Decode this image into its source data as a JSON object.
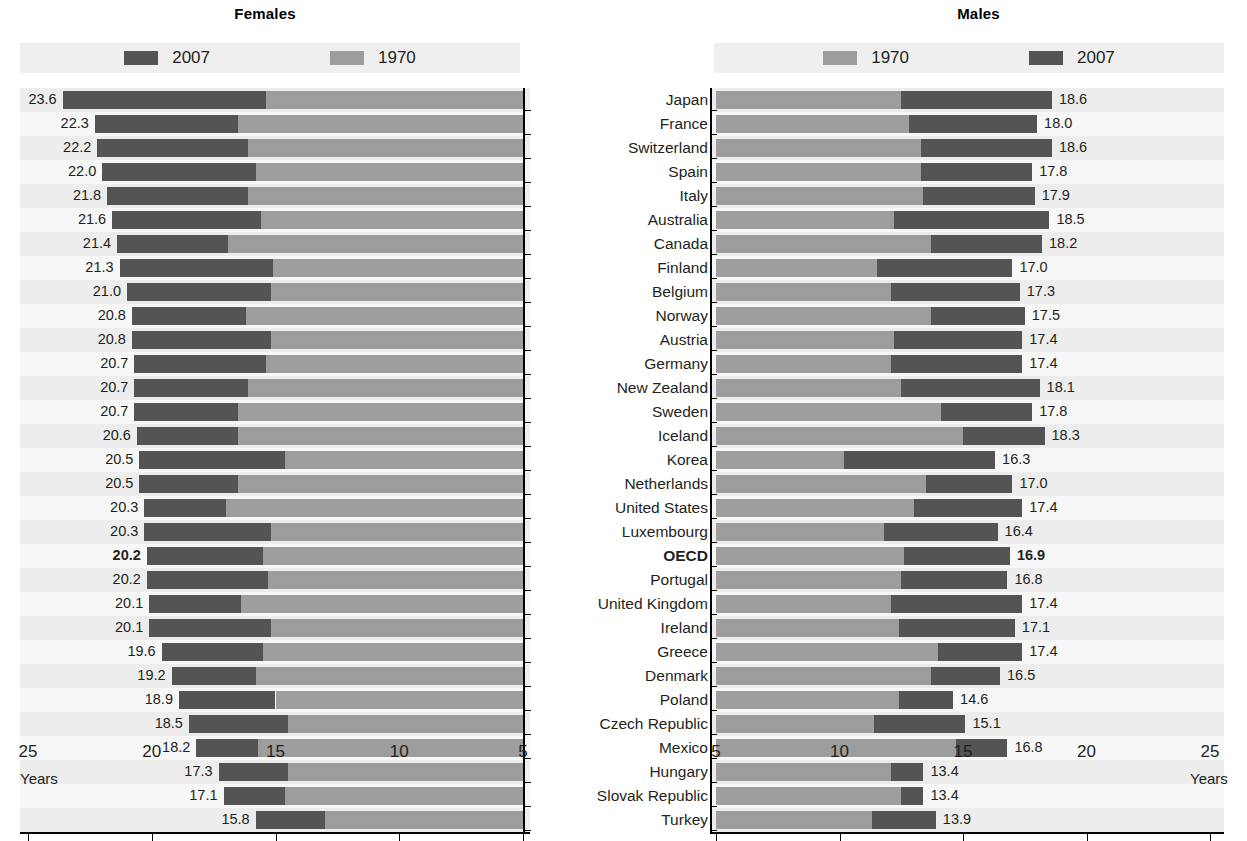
{
  "panels": {
    "females": {
      "title": "Females",
      "legend": [
        {
          "label": "2007",
          "color": "#545454",
          "series": "2007"
        },
        {
          "label": "1970",
          "color": "#9d9d9d",
          "series": "1970"
        }
      ],
      "axis_ticks": [
        "25",
        "20",
        "15",
        "10",
        "5"
      ],
      "axis_title": "Years"
    },
    "males": {
      "title": "Males",
      "legend": [
        {
          "label": "1970",
          "color": "#9d9d9d",
          "series": "1970"
        },
        {
          "label": "2007",
          "color": "#545454",
          "series": "2007"
        }
      ],
      "axis_ticks": [
        "5",
        "10",
        "15",
        "20",
        "25"
      ],
      "axis_title": "Years"
    }
  },
  "colors": {
    "series_2007": "#545454",
    "series_1970": "#9d9d9d",
    "legend_background": "#efefef",
    "row_band": "#ededed",
    "row_plain": "#f7f7f7",
    "text": "#231f20"
  },
  "chart_data": {
    "type": "bar",
    "xlabel": "Years",
    "ylabel": "",
    "orientation": "horizontal",
    "layout": "mirrored back-to-back panels, females left (axis reversed 25→5), males right (axis 5→25)",
    "grid": false,
    "legend_position": "top",
    "panels": [
      "Females",
      "Males"
    ],
    "xlim_females": [
      25,
      5
    ],
    "xlim_males": [
      5,
      25
    ],
    "xticks_females": [
      25,
      20,
      15,
      10,
      5
    ],
    "xticks_males": [
      5,
      10,
      15,
      20,
      25
    ],
    "categories": [
      "Japan",
      "France",
      "Switzerland",
      "Spain",
      "Italy",
      "Australia",
      "Canada",
      "Finland",
      "Belgium",
      "Norway",
      "Austria",
      "Germany",
      "New Zealand",
      "Sweden",
      "Iceland",
      "Korea",
      "Netherlands",
      "United States",
      "Luxembourg",
      "OECD",
      "Portugal",
      "United Kingdom",
      "Ireland",
      "Greece",
      "Denmark",
      "Poland",
      "Czech Republic",
      "Mexico",
      "Hungary",
      "Slovak Republic",
      "Turkey"
    ],
    "highlight_category": "OECD",
    "series": [
      {
        "name": "Females 2007",
        "panel": "Females",
        "year": "2007",
        "color": "#545454",
        "values": [
          23.6,
          22.3,
          22.2,
          22.0,
          21.8,
          21.6,
          21.4,
          21.3,
          21.0,
          20.8,
          20.8,
          20.7,
          20.7,
          20.7,
          20.6,
          20.5,
          20.5,
          20.3,
          20.3,
          20.2,
          20.2,
          20.1,
          20.1,
          19.6,
          19.2,
          18.9,
          18.5,
          18.2,
          17.3,
          17.1,
          15.8
        ]
      },
      {
        "name": "Females 1970",
        "panel": "Females",
        "year": "1970",
        "color": "#9d9d9d",
        "values": [
          15.4,
          16.5,
          16.1,
          15.8,
          16.1,
          15.6,
          16.9,
          15.1,
          15.2,
          16.2,
          15.2,
          15.4,
          16.1,
          16.5,
          16.5,
          14.6,
          16.5,
          17.0,
          15.2,
          15.5,
          15.3,
          16.4,
          15.2,
          15.5,
          15.8,
          15.0,
          14.5,
          15.7,
          14.5,
          14.6,
          13.0
        ]
      },
      {
        "name": "Males 2007",
        "panel": "Males",
        "year": "2007",
        "color": "#545454",
        "values": [
          18.6,
          18.0,
          18.6,
          17.8,
          17.9,
          18.5,
          18.2,
          17.0,
          17.3,
          17.5,
          17.4,
          17.4,
          18.1,
          17.8,
          18.3,
          16.3,
          17.0,
          17.4,
          16.4,
          16.9,
          16.8,
          17.4,
          17.1,
          17.4,
          16.5,
          14.6,
          15.1,
          16.8,
          13.4,
          13.4,
          13.9
        ]
      },
      {
        "name": "Males 1970",
        "panel": "Males",
        "year": "1970",
        "color": "#9d9d9d",
        "values": [
          12.5,
          12.8,
          13.3,
          13.3,
          13.4,
          12.2,
          13.7,
          11.5,
          12.1,
          13.7,
          12.2,
          12.1,
          12.5,
          14.1,
          15.0,
          10.2,
          13.5,
          13.0,
          11.8,
          12.6,
          12.5,
          12.1,
          12.4,
          14.0,
          13.7,
          12.4,
          11.4,
          14.7,
          12.1,
          12.5,
          11.3
        ]
      }
    ]
  },
  "rows": [
    {
      "country": "Japan",
      "f2007": "23.6",
      "f1970": 15.4,
      "m2007": "18.6",
      "m1970": 12.5,
      "bold": false
    },
    {
      "country": "France",
      "f2007": "22.3",
      "f1970": 16.5,
      "m2007": "18.0",
      "m1970": 12.8,
      "bold": false
    },
    {
      "country": "Switzerland",
      "f2007": "22.2",
      "f1970": 16.1,
      "m2007": "18.6",
      "m1970": 13.3,
      "bold": false
    },
    {
      "country": "Spain",
      "f2007": "22.0",
      "f1970": 15.8,
      "m2007": "17.8",
      "m1970": 13.3,
      "bold": false
    },
    {
      "country": "Italy",
      "f2007": "21.8",
      "f1970": 16.1,
      "m2007": "17.9",
      "m1970": 13.4,
      "bold": false
    },
    {
      "country": "Australia",
      "f2007": "21.6",
      "f1970": 15.6,
      "m2007": "18.5",
      "m1970": 12.2,
      "bold": false
    },
    {
      "country": "Canada",
      "f2007": "21.4",
      "f1970": 16.9,
      "m2007": "18.2",
      "m1970": 13.7,
      "bold": false
    },
    {
      "country": "Finland",
      "f2007": "21.3",
      "f1970": 15.1,
      "m2007": "17.0",
      "m1970": 11.5,
      "bold": false
    },
    {
      "country": "Belgium",
      "f2007": "21.0",
      "f1970": 15.2,
      "m2007": "17.3",
      "m1970": 12.1,
      "bold": false
    },
    {
      "country": "Norway",
      "f2007": "20.8",
      "f1970": 16.2,
      "m2007": "17.5",
      "m1970": 13.7,
      "bold": false
    },
    {
      "country": "Austria",
      "f2007": "20.8",
      "f1970": 15.2,
      "m2007": "17.4",
      "m1970": 12.2,
      "bold": false
    },
    {
      "country": "Germany",
      "f2007": "20.7",
      "f1970": 15.4,
      "m2007": "17.4",
      "m1970": 12.1,
      "bold": false
    },
    {
      "country": "New Zealand",
      "f2007": "20.7",
      "f1970": 16.1,
      "m2007": "18.1",
      "m1970": 12.5,
      "bold": false
    },
    {
      "country": "Sweden",
      "f2007": "20.7",
      "f1970": 16.5,
      "m2007": "17.8",
      "m1970": 14.1,
      "bold": false
    },
    {
      "country": "Iceland",
      "f2007": "20.6",
      "f1970": 16.5,
      "m2007": "18.3",
      "m1970": 15.0,
      "bold": false
    },
    {
      "country": "Korea",
      "f2007": "20.5",
      "f1970": 14.6,
      "m2007": "16.3",
      "m1970": 10.2,
      "bold": false
    },
    {
      "country": "Netherlands",
      "f2007": "20.5",
      "f1970": 16.5,
      "m2007": "17.0",
      "m1970": 13.5,
      "bold": false
    },
    {
      "country": "United States",
      "f2007": "20.3",
      "f1970": 17.0,
      "m2007": "17.4",
      "m1970": 13.0,
      "bold": false
    },
    {
      "country": "Luxembourg",
      "f2007": "20.3",
      "f1970": 15.2,
      "m2007": "16.4",
      "m1970": 11.8,
      "bold": false
    },
    {
      "country": "OECD",
      "f2007": "20.2",
      "f1970": 15.5,
      "m2007": "16.9",
      "m1970": 12.6,
      "bold": true
    },
    {
      "country": "Portugal",
      "f2007": "20.2",
      "f1970": 15.3,
      "m2007": "16.8",
      "m1970": 12.5,
      "bold": false
    },
    {
      "country": "United Kingdom",
      "f2007": "20.1",
      "f1970": 16.4,
      "m2007": "17.4",
      "m1970": 12.1,
      "bold": false
    },
    {
      "country": "Ireland",
      "f2007": "20.1",
      "f1970": 15.2,
      "m2007": "17.1",
      "m1970": 12.4,
      "bold": false
    },
    {
      "country": "Greece",
      "f2007": "19.6",
      "f1970": 15.5,
      "m2007": "17.4",
      "m1970": 14.0,
      "bold": false
    },
    {
      "country": "Denmark",
      "f2007": "19.2",
      "f1970": 15.8,
      "m2007": "16.5",
      "m1970": 13.7,
      "bold": false
    },
    {
      "country": "Poland",
      "f2007": "18.9",
      "f1970": 15.0,
      "m2007": "14.6",
      "m1970": 12.4,
      "bold": false
    },
    {
      "country": "Czech Republic",
      "f2007": "18.5",
      "f1970": 14.5,
      "m2007": "15.1",
      "m1970": 11.4,
      "bold": false
    },
    {
      "country": "Mexico",
      "f2007": "18.2",
      "f1970": 15.7,
      "m2007": "16.8",
      "m1970": 14.7,
      "bold": false
    },
    {
      "country": "Hungary",
      "f2007": "17.3",
      "f1970": 14.5,
      "m2007": "13.4",
      "m1970": 12.1,
      "bold": false
    },
    {
      "country": "Slovak Republic",
      "f2007": "17.1",
      "f1970": 14.6,
      "m2007": "13.4",
      "m1970": 12.5,
      "bold": false
    },
    {
      "country": "Turkey",
      "f2007": "15.8",
      "f1970": 13.0,
      "m2007": "13.9",
      "m1970": 11.3,
      "bold": false
    }
  ]
}
